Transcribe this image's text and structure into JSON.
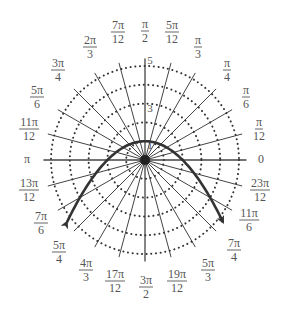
{
  "chart_data": {
    "type": "line",
    "coordinate_system": "polar",
    "title": "",
    "xlabel": "",
    "ylabel": "",
    "radial_range": [
      0,
      5
    ],
    "radial_circles": [
      1,
      2,
      3,
      4,
      5
    ],
    "radial_tick_labels": [
      "1",
      "3",
      "5"
    ],
    "grid": true,
    "grid_style": "dotted circles, solid spokes every pi/12",
    "angle_step": "pi/12",
    "angle_labels": [
      {
        "angle_deg": 0,
        "num": "0",
        "den": ""
      },
      {
        "angle_deg": 15,
        "num": "π",
        "den": "12"
      },
      {
        "angle_deg": 30,
        "num": "π",
        "den": "6"
      },
      {
        "angle_deg": 45,
        "num": "π",
        "den": "4"
      },
      {
        "angle_deg": 60,
        "num": "π",
        "den": "3"
      },
      {
        "angle_deg": 75,
        "num": "5π",
        "den": "12"
      },
      {
        "angle_deg": 90,
        "num": "π",
        "den": "2"
      },
      {
        "angle_deg": 105,
        "num": "7π",
        "den": "12"
      },
      {
        "angle_deg": 120,
        "num": "2π",
        "den": "3"
      },
      {
        "angle_deg": 135,
        "num": "3π",
        "den": "4"
      },
      {
        "angle_deg": 150,
        "num": "5π",
        "den": "6"
      },
      {
        "angle_deg": 165,
        "num": "11π",
        "den": "12"
      },
      {
        "angle_deg": 180,
        "num": "π",
        "den": ""
      },
      {
        "angle_deg": 195,
        "num": "13π",
        "den": "12"
      },
      {
        "angle_deg": 210,
        "num": "7π",
        "den": "6"
      },
      {
        "angle_deg": 225,
        "num": "5π",
        "den": "4"
      },
      {
        "angle_deg": 240,
        "num": "4π",
        "den": "3"
      },
      {
        "angle_deg": 255,
        "num": "17π",
        "den": "12"
      },
      {
        "angle_deg": 270,
        "num": "3π",
        "den": "2"
      },
      {
        "angle_deg": 285,
        "num": "19π",
        "den": "12"
      },
      {
        "angle_deg": 300,
        "num": "5π",
        "den": "3"
      },
      {
        "angle_deg": 315,
        "num": "7π",
        "den": "4"
      },
      {
        "angle_deg": 330,
        "num": "11π",
        "den": "6"
      },
      {
        "angle_deg": 345,
        "num": "23π",
        "den": "12"
      }
    ],
    "series": [
      {
        "name": "parabola (r = 2/(1 + sin θ))",
        "description": "Parabola with focus at pole, vertex at (r=1, θ=π/2), opening downward; arrows at both ends",
        "cartesian_equation": "y = 1 - x^2/4",
        "x_range": [
          -4.15,
          4.15
        ],
        "sample_points_xy": [
          [
            -4.15,
            -3.31
          ],
          [
            -3,
            -1.25
          ],
          [
            -2,
            0
          ],
          [
            -1,
            0.75
          ],
          [
            0,
            1
          ],
          [
            1,
            0.75
          ],
          [
            2,
            0
          ],
          [
            3,
            -1.25
          ],
          [
            4.15,
            -3.31
          ]
        ],
        "arrows": "both ends",
        "color": "#333333"
      }
    ]
  }
}
